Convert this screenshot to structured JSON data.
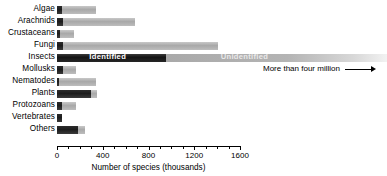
{
  "chart_data": {
    "type": "bar",
    "orientation": "horizontal",
    "stacked": true,
    "title": "",
    "xlabel": "Number of species (thousands)",
    "ylabel": "",
    "xlim": [
      0,
      1600
    ],
    "xticks": [
      0,
      400,
      800,
      1200,
      1600
    ],
    "xtick_labels": [
      "0",
      "400",
      "800",
      "1200",
      "1600"
    ],
    "minor_tick_step": 100,
    "grid": false,
    "legend": [
      "Identified",
      "Unidentified"
    ],
    "legend_position": "in-bar (Insects row)",
    "categories": [
      "Algae",
      "Arachnids",
      "Crustaceans",
      "Fungi",
      "Insects",
      "Mollusks",
      "Nematodes",
      "Plants",
      "Protozoans",
      "Vertebrates",
      "Others"
    ],
    "series": [
      {
        "name": "Identified",
        "color": "#1c1c1c",
        "values": [
          40,
          55,
          30,
          55,
          950,
          55,
          15,
          300,
          40,
          45,
          185
        ]
      },
      {
        "name": "Unidentified",
        "color": "#b0b0b0",
        "values": [
          305,
          630,
          120,
          1350,
          3050,
          115,
          325,
          50,
          125,
          0,
          60
        ]
      }
    ],
    "annotations": [
      {
        "text": "More than four million",
        "target_category": "Insects",
        "arrow": "right"
      }
    ]
  },
  "axis": {
    "title": "Number of species (thousands)",
    "ticks": [
      "0",
      "400",
      "800",
      "1200",
      "1600"
    ]
  },
  "bar_labels": {
    "identified": "Identified",
    "unidentified": "Unidentified"
  },
  "annotation": {
    "more_than_four_million": "More than four million"
  }
}
